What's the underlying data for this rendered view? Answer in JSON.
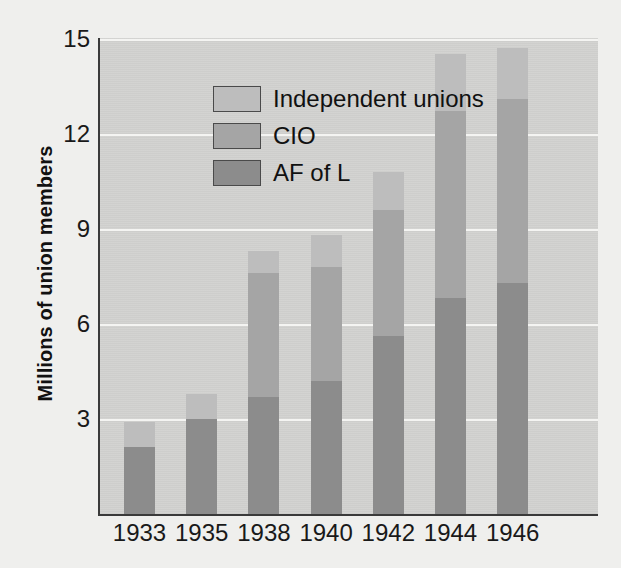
{
  "chart_data": {
    "type": "bar",
    "subtype": "stacked",
    "title": "",
    "xlabel": "",
    "ylabel": "Millions of union members",
    "categories": [
      "1933",
      "1935",
      "1938",
      "1940",
      "1942",
      "1944",
      "1946"
    ],
    "yticks": [
      3,
      6,
      9,
      12,
      15
    ],
    "ylim": [
      0,
      15.4
    ],
    "grid": true,
    "legend_position": "top-left",
    "series": [
      {
        "name": "AF of L",
        "color": "#8c8c8c",
        "values": [
          2.1,
          3.0,
          3.7,
          4.2,
          5.6,
          6.8,
          7.3
        ]
      },
      {
        "name": "CIO",
        "color": "#a5a5a5",
        "values": [
          0.0,
          0.0,
          3.9,
          3.6,
          4.0,
          5.9,
          5.8
        ]
      },
      {
        "name": "Independent unions",
        "color": "#bdbdbd",
        "values": [
          0.8,
          0.8,
          0.7,
          1.0,
          1.2,
          1.8,
          1.6
        ]
      }
    ],
    "totals": [
      2.9,
      3.8,
      8.3,
      8.8,
      10.8,
      14.5,
      14.7
    ],
    "cumulative_tops": [
      {
        "afl": 2.1,
        "cio": 2.1,
        "ind": 2.9
      },
      {
        "afl": 3.0,
        "cio": 3.0,
        "ind": 3.8
      },
      {
        "afl": 3.7,
        "cio": 7.6,
        "ind": 8.3
      },
      {
        "afl": 4.2,
        "cio": 7.8,
        "ind": 8.8
      },
      {
        "afl": 5.6,
        "cio": 9.6,
        "ind": 10.8
      },
      {
        "afl": 6.8,
        "cio": 12.7,
        "ind": 14.5
      },
      {
        "afl": 7.3,
        "cio": 13.1,
        "ind": 14.7
      }
    ]
  },
  "legend": {
    "items": [
      {
        "label": "Independent unions",
        "key": "ind"
      },
      {
        "label": "CIO",
        "key": "cio"
      },
      {
        "label": "AF of L",
        "key": "afl"
      }
    ]
  },
  "colors": {
    "background": "#efefed",
    "plot_background": "#d2d2d0",
    "gridline": "#f4f4f2",
    "axis": "#3a3a3a",
    "afl": "#8c8c8c",
    "cio": "#a5a5a5",
    "independent": "#bdbdbd",
    "text": "#111111"
  }
}
